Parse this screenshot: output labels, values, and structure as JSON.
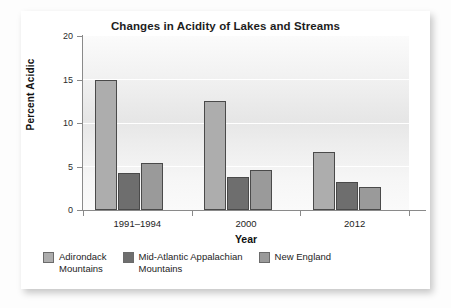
{
  "card": {
    "title": "Changes in Acidity of Lakes and Streams"
  },
  "axes": {
    "y_title": "Percent Acidic",
    "x_title": "Year",
    "y_ticks": [
      "0",
      "5",
      "10",
      "15",
      "20"
    ]
  },
  "legend": {
    "items": [
      {
        "label": "Adirondack\nMountains",
        "color": "#adadad"
      },
      {
        "label": "Mid-Atlantic Appalachian\nMountains",
        "color": "#6e6e6e"
      },
      {
        "label": "New England",
        "color": "#9a9a9a"
      }
    ]
  },
  "chart_data": {
    "type": "bar",
    "title": "Changes in Acidity of Lakes and Streams",
    "xlabel": "Year",
    "ylabel": "Percent Acidic",
    "ylim": [
      0,
      20
    ],
    "yticks": [
      0,
      5,
      10,
      15,
      20
    ],
    "grid": true,
    "legend_position": "bottom",
    "categories": [
      "1991–1994",
      "2000",
      "2012"
    ],
    "series": [
      {
        "name": "Adirondack Mountains",
        "color": "#adadad",
        "values": [
          15.0,
          12.5,
          6.7
        ]
      },
      {
        "name": "Mid-Atlantic Appalachian Mountains",
        "color": "#6e6e6e",
        "values": [
          4.2,
          3.8,
          3.2
        ]
      },
      {
        "name": "New England",
        "color": "#9a9a9a",
        "values": [
          5.4,
          4.6,
          2.6
        ]
      }
    ]
  }
}
